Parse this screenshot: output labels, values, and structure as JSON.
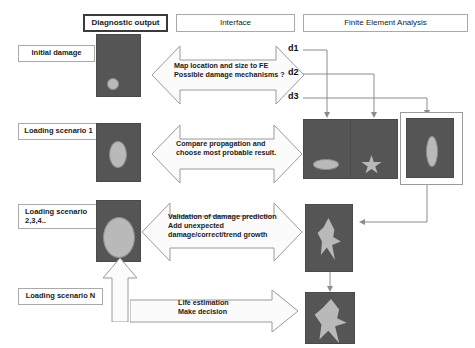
{
  "diagram": {
    "columns": [
      {
        "id": "diagnostic-output",
        "label": "Diagnostic output",
        "emphasis": true
      },
      {
        "id": "interface",
        "label": "Interface",
        "emphasis": false
      },
      {
        "id": "finite-element-analysis",
        "label": "Finite Element Analysis",
        "emphasis": false
      }
    ],
    "stage_labels": [
      {
        "id": "initial-damage",
        "label": "Initial damage"
      },
      {
        "id": "loading-scenario-1",
        "label": "Loading scenario 1"
      },
      {
        "id": "loading-scenario-234",
        "label": "Loading scenario\n2,3,4.."
      },
      {
        "id": "loading-scenario-n",
        "label": "Loading scenario N"
      }
    ],
    "interface_arrows": [
      {
        "id": "map-location",
        "direction": "double",
        "lines": [
          "Map location and size to FE",
          "Possible damage mechanisms ?"
        ]
      },
      {
        "id": "compare-propagation",
        "direction": "double",
        "lines": [
          "Compare propagation and",
          "choose most probable result."
        ]
      },
      {
        "id": "validation",
        "direction": "double",
        "lines": [
          "Validation of damage prediction",
          "Add unexpected",
          "damage/correct/trend growth"
        ]
      },
      {
        "id": "life-estimation",
        "direction": "right",
        "lines": [
          "Life estimation",
          "Make decision"
        ]
      }
    ],
    "damage_candidates": [
      {
        "id": "d1",
        "label": "d1",
        "shape": "horizontal-ellipse"
      },
      {
        "id": "d2",
        "label": "d2",
        "shape": "star"
      },
      {
        "id": "d3",
        "label": "d3",
        "shape": "vertical-ellipse",
        "selected": true
      }
    ],
    "diagnostic_panels": [
      {
        "id": "diagnostic-panel-initial",
        "shape": "small-circle"
      },
      {
        "id": "diagnostic-panel-scenario-1",
        "shape": "small-ellipse"
      },
      {
        "id": "diagnostic-panel-scenario-234",
        "shape": "large-ellipse"
      }
    ],
    "fe_panels": [
      {
        "id": "fe-panel-d1",
        "shape": "horizontal-ellipse"
      },
      {
        "id": "fe-panel-d2",
        "shape": "star"
      },
      {
        "id": "fe-panel-d3",
        "shape": "vertical-ellipse"
      },
      {
        "id": "fe-panel-growth",
        "shape": "teardrop"
      },
      {
        "id": "fe-panel-final",
        "shape": "large-teardrop"
      }
    ],
    "colors": {
      "panel_fill": "#555555",
      "blob_fill": "#b9b9b9",
      "box_border": "#a9a9a9",
      "emphasis_border": "#3a3a3a",
      "arrow_fill": "#fbfbfb",
      "arrow_stroke": "#9a9a9a",
      "wire": "#8c8c8c",
      "text": "#1a1a1a",
      "background": "#ffffff"
    }
  }
}
